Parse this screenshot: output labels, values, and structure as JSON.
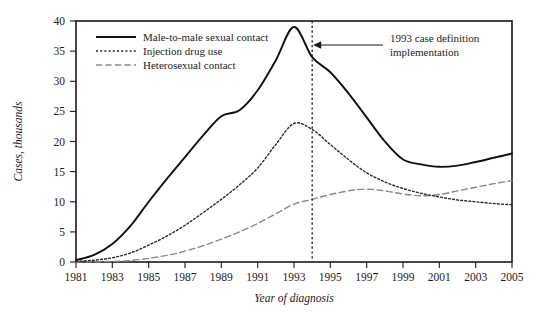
{
  "chart_data": {
    "type": "line",
    "title": "",
    "xlabel": "Year of diagnosis",
    "ylabel": "Cases, thousands",
    "xlim": [
      1981,
      2005
    ],
    "ylim": [
      0,
      40
    ],
    "xticks": [
      "1981",
      "1983",
      "1985",
      "1987",
      "1989",
      "1991",
      "1993",
      "1995",
      "1997",
      "1999",
      "2001",
      "2003",
      "2005"
    ],
    "yticks": [
      "0",
      "5",
      "10",
      "15",
      "20",
      "25",
      "30",
      "35",
      "40"
    ],
    "grid": false,
    "legend_position": "top-left",
    "x": [
      1981,
      1982,
      1983,
      1984,
      1985,
      1986,
      1987,
      1988,
      1989,
      1990,
      1991,
      1992,
      1993,
      1994,
      1995,
      1996,
      1997,
      1998,
      1999,
      2000,
      2001,
      2002,
      2003,
      2004,
      2005
    ],
    "series": [
      {
        "name": "Male-to-male sexual contact",
        "style": "solid",
        "color": "#101010",
        "values": [
          0.3,
          1.2,
          3.0,
          6.0,
          10.0,
          13.8,
          17.4,
          21.0,
          24.2,
          25.2,
          28.5,
          33.5,
          39.0,
          34.0,
          31.5,
          28.0,
          24.0,
          20.0,
          17.0,
          16.2,
          15.8,
          16.0,
          16.6,
          17.3,
          18.0
        ]
      },
      {
        "name": "Injection drug use",
        "style": "dotted",
        "color": "#2a2a2a",
        "values": [
          0.1,
          0.3,
          0.7,
          1.5,
          2.8,
          4.3,
          6.1,
          8.2,
          10.4,
          12.8,
          15.6,
          19.5,
          23.0,
          22.0,
          19.5,
          17.0,
          14.8,
          13.3,
          12.2,
          11.4,
          10.8,
          10.3,
          10.0,
          9.7,
          9.5
        ]
      },
      {
        "name": "Heterosexual contact",
        "style": "dashed",
        "color": "#8a8a8a",
        "values": [
          0.0,
          0.05,
          0.1,
          0.25,
          0.6,
          1.1,
          1.8,
          2.7,
          3.8,
          5.0,
          6.4,
          8.0,
          9.6,
          10.4,
          11.2,
          11.8,
          12.1,
          11.8,
          11.3,
          11.0,
          11.2,
          11.8,
          12.4,
          13.0,
          13.5
        ]
      }
    ],
    "annotations": [
      {
        "name": "case-definition-marker",
        "text_line1": "1993 case definition",
        "text_line2": "implementation",
        "marker_x": 1994,
        "style": "vertical-dashed-line-with-arrow"
      }
    ]
  },
  "legend": {
    "items": [
      {
        "label": "Male-to-male sexual contact"
      },
      {
        "label": "Injection drug use"
      },
      {
        "label": "Heterosexual contact"
      }
    ]
  }
}
